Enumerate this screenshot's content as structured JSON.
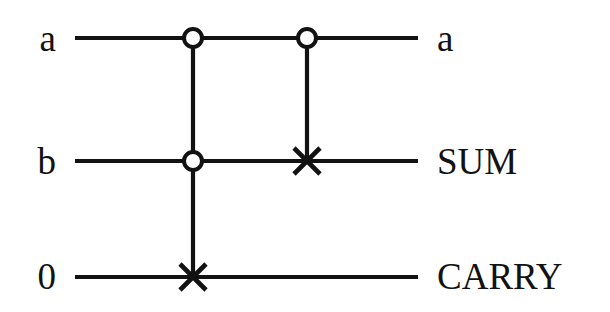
{
  "figure": {
    "kind": "quantum-circuit-diagram",
    "title": "",
    "background_color": "#ffffff",
    "ink_color": "#121212"
  },
  "inputs": [
    {
      "label": "a",
      "wire": "top"
    },
    {
      "label": "b",
      "wire": "middle"
    },
    {
      "label": "0",
      "wire": "bottom"
    }
  ],
  "outputs": [
    {
      "label": "a",
      "wire": "top"
    },
    {
      "label": "SUM",
      "wire": "middle"
    },
    {
      "label": "CARRY",
      "wire": "bottom"
    }
  ],
  "wires": [
    {
      "name": "top",
      "y": 38,
      "x_start": 75,
      "x_end": 418
    },
    {
      "name": "middle",
      "y": 161,
      "x_start": 75,
      "x_end": 418
    },
    {
      "name": "bottom",
      "y": 277,
      "x_start": 75,
      "x_end": 418
    }
  ],
  "gates": [
    {
      "name": "toffoli-carry",
      "column_x": 193,
      "controls": [
        {
          "wire": "top",
          "x": 193,
          "y": 38,
          "style": "open-circle",
          "radius": 9
        },
        {
          "wire": "middle",
          "x": 193,
          "y": 161,
          "style": "open-circle",
          "radius": 9
        }
      ],
      "target": {
        "wire": "bottom",
        "x": 193,
        "y": 277,
        "style": "cross",
        "size": 13
      },
      "link": {
        "x": 193,
        "y_top": 38,
        "y_bottom": 277
      }
    },
    {
      "name": "cnot-sum",
      "column_x": 307,
      "controls": [
        {
          "wire": "top",
          "x": 307,
          "y": 38,
          "style": "open-circle",
          "radius": 9
        }
      ],
      "target": {
        "wire": "middle",
        "x": 307,
        "y": 161,
        "style": "cross",
        "size": 13
      },
      "link": {
        "x": 307,
        "y_top": 38,
        "y_bottom": 161
      }
    }
  ]
}
